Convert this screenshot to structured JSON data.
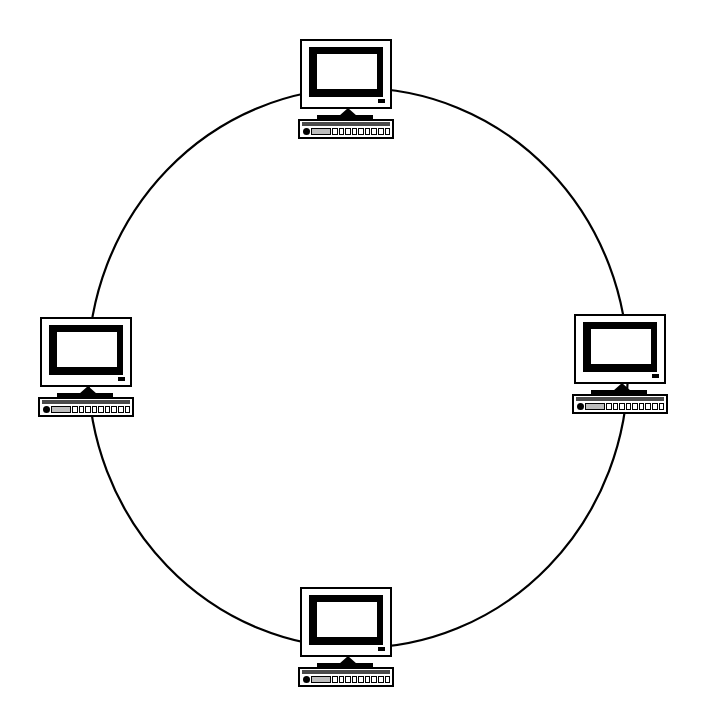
{
  "diagram": {
    "topology_type": "ring",
    "background_color": "#ffffff",
    "line_color": "#000000",
    "canvas": {
      "width": 704,
      "height": 720
    },
    "ring": {
      "shape": "circle",
      "center_x": 358,
      "center_y": 368,
      "radius_x": 270,
      "radius_y": 280,
      "stroke_width": 2,
      "stroke_color": "#000000",
      "fill": "none"
    },
    "nodes": [
      {
        "id": "node-top",
        "label": "Computer Workstation Top",
        "position": "top",
        "x": 348,
        "y": 90,
        "device_type": "desktop-computer"
      },
      {
        "id": "node-right",
        "label": "Computer Workstation Right",
        "position": "right",
        "x": 622,
        "y": 365,
        "device_type": "desktop-computer"
      },
      {
        "id": "node-bottom",
        "label": "Computer Workstation Bottom",
        "position": "bottom",
        "x": 348,
        "y": 638,
        "device_type": "desktop-computer"
      },
      {
        "id": "node-left",
        "label": "Computer Workstation Left",
        "position": "left",
        "x": 88,
        "y": 368,
        "device_type": "desktop-computer"
      }
    ],
    "node_parts": {
      "monitor": "monitor-case",
      "bezel": "screen-bezel",
      "screen": "screen-display",
      "led": "power-led-indicator",
      "neck": "monitor-stand-neck",
      "base": "monitor-stand-base",
      "keyboard": "keyboard",
      "trackball": "trackball-dot"
    },
    "keyboard_key_count": 9
  }
}
